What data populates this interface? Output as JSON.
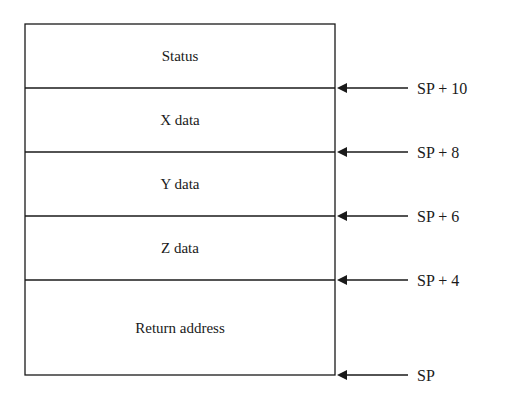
{
  "diagram": {
    "type": "stack-frame",
    "cells": [
      {
        "label": "Status"
      },
      {
        "label": "X data"
      },
      {
        "label": "Y data"
      },
      {
        "label": "Z data"
      },
      {
        "label": "Return address"
      }
    ],
    "pointers": [
      {
        "label": "SP + 10",
        "boundary": 1
      },
      {
        "label": "SP + 8",
        "boundary": 2
      },
      {
        "label": "SP + 6",
        "boundary": 3
      },
      {
        "label": "SP + 4",
        "boundary": 4
      },
      {
        "label": "SP",
        "boundary": 5
      }
    ],
    "colors": {
      "line": "#1a1a1a",
      "background": "#ffffff"
    }
  }
}
